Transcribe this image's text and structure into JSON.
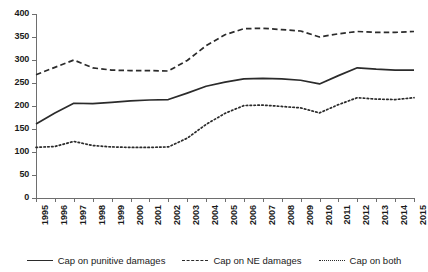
{
  "chart_data": {
    "type": "line",
    "title": "",
    "subtitle": "",
    "xlabel": "",
    "ylabel": "",
    "xlim": [
      1995,
      2015
    ],
    "ylim": [
      0,
      400
    ],
    "grid": false,
    "legend_position": "bottom",
    "categories": [
      "1995",
      "1996",
      "1997",
      "1998",
      "1999",
      "2000",
      "2001",
      "2002",
      "2003",
      "2004",
      "2005",
      "2006",
      "2007",
      "2008",
      "2009",
      "2010",
      "2011",
      "2012",
      "2013",
      "2014",
      "2015"
    ],
    "x": [
      1995,
      1996,
      1997,
      1998,
      1999,
      2000,
      2001,
      2002,
      2003,
      2004,
      2005,
      2006,
      2007,
      2008,
      2009,
      2010,
      2011,
      2012,
      2013,
      2014,
      2015
    ],
    "ytick_labels": [
      "400",
      "350",
      "300",
      "250",
      "200",
      "150",
      "100",
      "50",
      "0"
    ],
    "ytick_values": [
      400,
      350,
      300,
      250,
      200,
      150,
      100,
      50,
      0
    ],
    "series": [
      {
        "name": "Cap on punitive damages",
        "style": "solid",
        "color": "#2b2b2b",
        "values": [
          161,
          185,
          206,
          205,
          208,
          211,
          213,
          214,
          228,
          243,
          252,
          259,
          260,
          259,
          256,
          248,
          266,
          283,
          280,
          278,
          278
        ]
      },
      {
        "name": "Cap on NE damages",
        "style": "dashed",
        "color": "#2b2b2b",
        "values": [
          268,
          284,
          300,
          283,
          278,
          277,
          277,
          276,
          299,
          331,
          355,
          368,
          369,
          366,
          363,
          350,
          357,
          362,
          360,
          360,
          362
        ]
      },
      {
        "name": "Cap on both",
        "style": "dotted",
        "color": "#2b2b2b",
        "values": [
          110,
          112,
          123,
          114,
          111,
          110,
          110,
          111,
          130,
          160,
          184,
          201,
          202,
          199,
          196,
          185,
          203,
          218,
          215,
          214,
          218
        ]
      }
    ]
  },
  "legend": {
    "items": [
      {
        "label": "Cap on punitive damages",
        "style": "solid"
      },
      {
        "label": "Cap on NE damages",
        "style": "dashed"
      },
      {
        "label": "Cap on both",
        "style": "dotted"
      }
    ]
  }
}
